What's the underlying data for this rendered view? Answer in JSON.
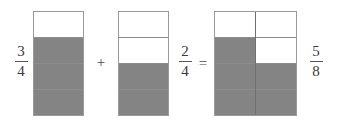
{
  "equation": {
    "expression": "3/4 + 2/4 = 5/8",
    "operators": {
      "plus": "+",
      "equals": "="
    }
  },
  "terms": [
    {
      "id": "first-term",
      "label": {
        "numerator": "3",
        "denominator": "4"
      },
      "model": {
        "columns": 1,
        "rows": 4,
        "total_cells": 4,
        "shaded_cells": 3,
        "cells": [
          [
            false,
            true,
            true,
            true
          ]
        ]
      }
    },
    {
      "id": "second-term",
      "label": {
        "numerator": "2",
        "denominator": "4"
      },
      "model": {
        "columns": 1,
        "rows": 4,
        "total_cells": 4,
        "shaded_cells": 2,
        "cells": [
          [
            false,
            false,
            true,
            true
          ]
        ]
      }
    },
    {
      "id": "result-term",
      "label": {
        "numerator": "5",
        "denominator": "8"
      },
      "model": {
        "columns": 2,
        "rows": 4,
        "total_cells": 8,
        "shaded_cells": 5,
        "cells": [
          [
            false,
            true,
            true,
            true
          ],
          [
            false,
            false,
            true,
            true
          ]
        ]
      }
    }
  ],
  "colors": {
    "shaded": "#848484",
    "unshaded": "#ffffff",
    "outline": "#9a9a9a",
    "divider": "#8d8d8d",
    "column_divider": "#6f6f6f",
    "text": "#3a3a3a",
    "background": "#ffffff"
  }
}
